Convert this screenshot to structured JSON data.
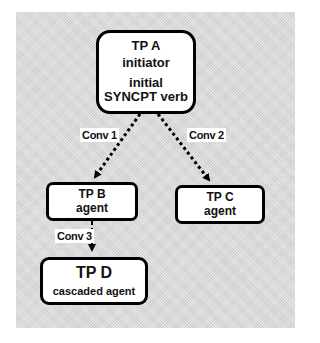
{
  "diagram": {
    "nodes": [
      {
        "id": "A",
        "lines": [
          "TP A",
          "initiator",
          "initial",
          "SYNCPT verb"
        ]
      },
      {
        "id": "B",
        "lines": [
          "TP B",
          "agent"
        ]
      },
      {
        "id": "C",
        "lines": [
          "TP C",
          "agent"
        ]
      },
      {
        "id": "D",
        "lines": [
          "TP D",
          "cascaded agent"
        ]
      }
    ],
    "edges": [
      {
        "from": "A",
        "to": "B",
        "label": "Conv 1",
        "style": "dotted-arrow"
      },
      {
        "from": "A",
        "to": "C",
        "label": "Conv 2",
        "style": "dotted-arrow"
      },
      {
        "from": "B",
        "to": "D",
        "label": "Conv 3",
        "style": "dashed-arrow"
      }
    ],
    "colors": {
      "background": "#d9d9d9",
      "box_fill": "#ffffff",
      "stroke": "#000000"
    }
  }
}
